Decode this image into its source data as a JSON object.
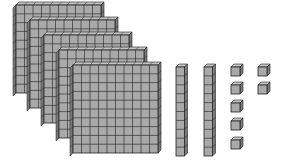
{
  "figure": {
    "title": "Base-ten blocks representation",
    "represented_value": 527,
    "colors": {
      "face": "#a9a9a9",
      "top": "#c4c4c4",
      "side": "#7a7a7a",
      "grid": "#222222",
      "background": "#ffffff"
    },
    "flats": {
      "count": 5,
      "unit_value": 100,
      "grid_size": 10,
      "items": [
        {
          "x": 16,
          "y": 5
        },
        {
          "x": 30,
          "y": 20
        },
        {
          "x": 44,
          "y": 35
        },
        {
          "x": 59,
          "y": 50
        },
        {
          "x": 73,
          "y": 65
        }
      ]
    },
    "rods": {
      "count": 2,
      "unit_value": 10,
      "length": 10,
      "items": [
        {
          "x": 176,
          "y": 64
        },
        {
          "x": 204,
          "y": 64
        }
      ]
    },
    "units": {
      "count": 7,
      "unit_value": 1,
      "items": [
        {
          "x": 231,
          "y": 64
        },
        {
          "x": 231,
          "y": 82
        },
        {
          "x": 231,
          "y": 100
        },
        {
          "x": 231,
          "y": 118
        },
        {
          "x": 231,
          "y": 137
        },
        {
          "x": 258,
          "y": 64
        },
        {
          "x": 258,
          "y": 82
        }
      ]
    }
  }
}
